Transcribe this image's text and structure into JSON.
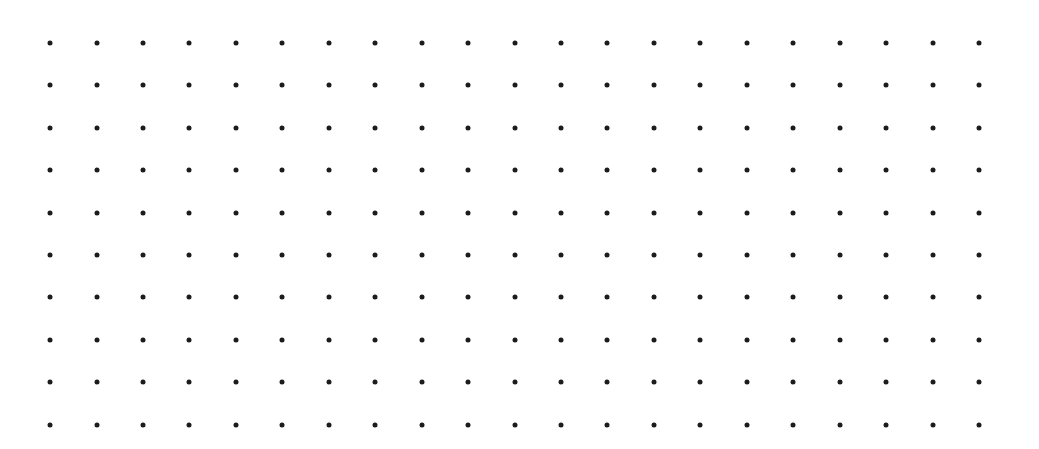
{
  "canvas": {
    "width": 1039,
    "height": 449,
    "background": "#ffffff"
  },
  "dot_grid": {
    "columns": 21,
    "rows": 10,
    "origin_x": 50,
    "origin_y": 43,
    "spacing_x": 46.45,
    "spacing_y": 42.4,
    "dot_diameter": 5,
    "dot_color": "#1c1c1c"
  }
}
